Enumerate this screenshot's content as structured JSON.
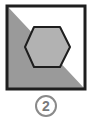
{
  "figure": {
    "option_number": "2",
    "colors": {
      "border": "#1e1e1e",
      "triangle_fill": "#9a9a9a",
      "hexagon_fill": "#b2b2b2",
      "background": "#ffffff",
      "label_circle": "#8a8a8a",
      "label_text": "#7a7a7a"
    }
  }
}
